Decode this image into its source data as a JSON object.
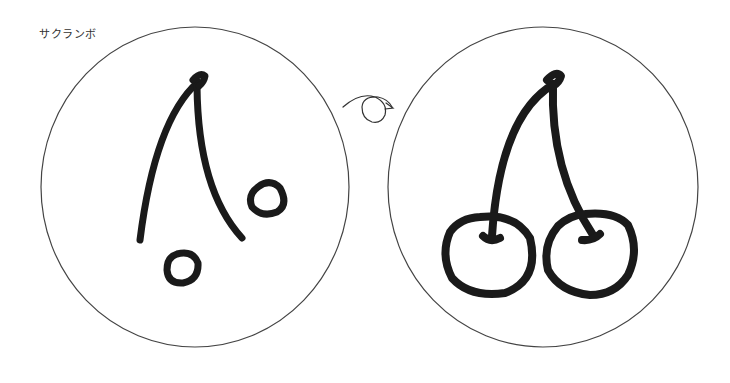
{
  "title": "サクランボ",
  "colors": {
    "background": "#ffffff",
    "outline": "#444444",
    "ink": "#1a1a1a"
  },
  "panels": [
    {
      "name": "before",
      "description": "cherry parts: stems and two small circles"
    },
    {
      "name": "after",
      "description": "complete cherry pair"
    }
  ],
  "arrow": {
    "icon": "loop-arrow-icon"
  }
}
